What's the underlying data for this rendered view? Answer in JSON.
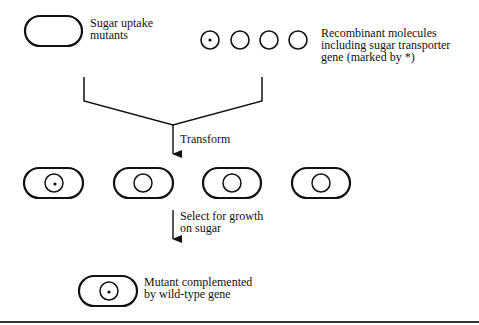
{
  "diagram": {
    "labels": {
      "mutants": [
        "Sugar uptake",
        "mutants"
      ],
      "recombinant": [
        "Recombinant molecules",
        "including sugar transporter",
        "gene (marked by *)"
      ],
      "transform": "Transform",
      "select": [
        "Select for growth",
        "on sugar"
      ],
      "complemented": [
        "Mutant complemented",
        "by wild-type gene"
      ]
    },
    "molecules": [
      {
        "marked": true
      },
      {
        "marked": false
      },
      {
        "marked": false
      },
      {
        "marked": false
      }
    ],
    "transformed_cells": [
      {
        "marked": true
      },
      {
        "marked": false
      },
      {
        "marked": false
      },
      {
        "marked": false
      }
    ],
    "steps": [
      "Transform",
      "Select for growth on sugar"
    ],
    "colors": {
      "stroke": "#111111",
      "background": "#ffffff"
    }
  }
}
